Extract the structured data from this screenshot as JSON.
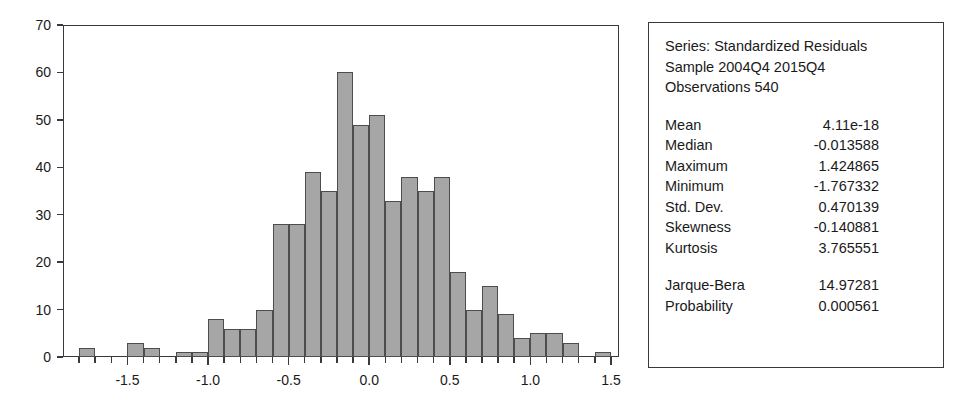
{
  "chart_data": {
    "type": "bar",
    "title": "",
    "xlabel": "",
    "ylabel": "",
    "xlim": [
      -1.9,
      1.55
    ],
    "ylim": [
      0,
      70
    ],
    "grid": false,
    "legend_position": "none",
    "bin_width": 0.1,
    "y_ticks": [
      70,
      60,
      50,
      40,
      30,
      20,
      10,
      0
    ],
    "x_ticks": [
      -1.5,
      -1.0,
      -0.5,
      0.0,
      0.5,
      1.0,
      1.5
    ],
    "x_tick_labels": [
      "-1.5",
      "-1.0",
      "-0.5",
      "0.0",
      "0.5",
      "1.0",
      "1.5"
    ],
    "bins": [
      {
        "left": -1.8,
        "right": -1.7,
        "count": 2
      },
      {
        "left": -1.7,
        "right": -1.6,
        "count": 0
      },
      {
        "left": -1.6,
        "right": -1.5,
        "count": 0
      },
      {
        "left": -1.5,
        "right": -1.4,
        "count": 3
      },
      {
        "left": -1.4,
        "right": -1.3,
        "count": 2
      },
      {
        "left": -1.3,
        "right": -1.2,
        "count": 0
      },
      {
        "left": -1.2,
        "right": -1.1,
        "count": 1
      },
      {
        "left": -1.1,
        "right": -1.0,
        "count": 1
      },
      {
        "left": -1.0,
        "right": -0.9,
        "count": 8
      },
      {
        "left": -0.9,
        "right": -0.8,
        "count": 6
      },
      {
        "left": -0.8,
        "right": -0.7,
        "count": 6
      },
      {
        "left": -0.7,
        "right": -0.6,
        "count": 10
      },
      {
        "left": -0.6,
        "right": -0.5,
        "count": 28
      },
      {
        "left": -0.5,
        "right": -0.4,
        "count": 28
      },
      {
        "left": -0.4,
        "right": -0.3,
        "count": 39
      },
      {
        "left": -0.3,
        "right": -0.2,
        "count": 35
      },
      {
        "left": -0.2,
        "right": -0.1,
        "count": 60
      },
      {
        "left": -0.1,
        "right": 0.0,
        "count": 49
      },
      {
        "left": 0.0,
        "right": 0.1,
        "count": 51
      },
      {
        "left": 0.1,
        "right": 0.2,
        "count": 33
      },
      {
        "left": 0.2,
        "right": 0.3,
        "count": 38
      },
      {
        "left": 0.3,
        "right": 0.4,
        "count": 35
      },
      {
        "left": 0.4,
        "right": 0.5,
        "count": 38
      },
      {
        "left": 0.5,
        "right": 0.6,
        "count": 18
      },
      {
        "left": 0.6,
        "right": 0.7,
        "count": 10
      },
      {
        "left": 0.7,
        "right": 0.8,
        "count": 15
      },
      {
        "left": 0.8,
        "right": 0.9,
        "count": 9
      },
      {
        "left": 0.9,
        "right": 1.0,
        "count": 4
      },
      {
        "left": 1.0,
        "right": 1.1,
        "count": 5
      },
      {
        "left": 1.1,
        "right": 1.2,
        "count": 5
      },
      {
        "left": 1.2,
        "right": 1.3,
        "count": 3
      },
      {
        "left": 1.3,
        "right": 1.4,
        "count": 0
      },
      {
        "left": 1.4,
        "right": 1.5,
        "count": 1
      }
    ]
  },
  "stats_panel": {
    "series_line": "Series: Standardized Residuals",
    "sample_line": "Sample 2004Q4 2015Q4",
    "observations_line": "Observations 540",
    "rows": [
      {
        "label": "Mean",
        "value": "4.11e-18"
      },
      {
        "label": "Median",
        "value": "-0.013588"
      },
      {
        "label": "Maximum",
        "value": "1.424865"
      },
      {
        "label": "Minimum",
        "value": "-1.767332"
      },
      {
        "label": "Std. Dev.",
        "value": "0.470139"
      },
      {
        "label": "Skewness",
        "value": "-0.140881"
      },
      {
        "label": "Kurtosis",
        "value": "3.765551"
      }
    ],
    "test_rows": [
      {
        "label": "Jarque-Bera",
        "value": "14.97281"
      },
      {
        "label": "Probability",
        "value": "0.000561"
      }
    ]
  },
  "colors": {
    "bar_fill": "#a6a6a6",
    "bar_border": "#4d4d4d",
    "axis": "#3a3a3a",
    "text": "#1a1a1a",
    "background": "#ffffff"
  }
}
